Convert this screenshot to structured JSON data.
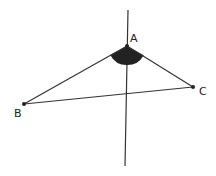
{
  "diagram": {
    "type": "geometry-triangle-angle",
    "points": [
      {
        "id": "A",
        "label": "A",
        "x": 127,
        "y": 46
      },
      {
        "id": "B",
        "label": "B",
        "x": 24,
        "y": 104
      },
      {
        "id": "C",
        "label": "C",
        "x": 193,
        "y": 87
      }
    ],
    "segments": [
      [
        "A",
        "B"
      ],
      [
        "A",
        "C"
      ],
      [
        "B",
        "C"
      ]
    ],
    "vertical_line": {
      "x1": 128,
      "y1": 10,
      "x2": 125,
      "y2": 166
    },
    "shaded_angle": {
      "vertex": "A",
      "between": [
        "B",
        "C"
      ],
      "radius": 19,
      "fill": "#222222"
    },
    "colors": {
      "line": "#333333",
      "point": "#222222",
      "background": "#ffffff"
    }
  }
}
